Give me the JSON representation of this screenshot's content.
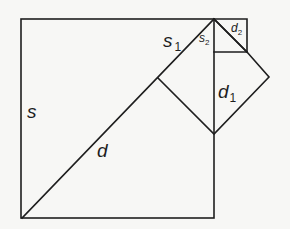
{
  "diagram": {
    "labels": {
      "s": {
        "base": "s",
        "sub": ""
      },
      "d": {
        "base": "d",
        "sub": ""
      },
      "s1": {
        "base": "s",
        "sub": "1"
      },
      "d1": {
        "base": "d",
        "sub": "1"
      },
      "s2": {
        "base": "s",
        "sub": "2"
      },
      "d2": {
        "base": "d",
        "sub": "2"
      }
    },
    "colors": {
      "line": "#1e1e1e",
      "background": "#f7f7f5"
    }
  }
}
